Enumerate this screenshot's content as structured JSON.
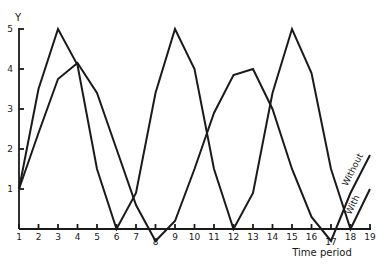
{
  "chart_data": {
    "type": "line",
    "title": "",
    "xlabel": "Time period",
    "ylabel": "Y",
    "x": [
      1,
      2,
      3,
      4,
      5,
      6,
      7,
      8,
      9,
      10,
      11,
      12,
      13,
      14,
      15,
      16,
      17,
      18,
      19
    ],
    "x_tick_labels": [
      "1",
      "2",
      "3",
      "4",
      "5",
      "6",
      "7",
      "8",
      "9",
      "10",
      "11",
      "12",
      "13",
      "14",
      "15",
      "16",
      "17",
      "18",
      "19"
    ],
    "y_tick_labels": [
      "1",
      "2",
      "3",
      "4",
      "5"
    ],
    "y_ticks": [
      1,
      2,
      3,
      4,
      5
    ],
    "xlim": [
      1,
      19
    ],
    "ylim": [
      0,
      5
    ],
    "grid": false,
    "legend": "inline labels at right end of lines",
    "series": [
      {
        "name": "With",
        "values": [
          1,
          3.5,
          5,
          4.1,
          1.5,
          0,
          0.9,
          3.4,
          5,
          4,
          1.5,
          0,
          0.9,
          3.4,
          5,
          3.9,
          1.5,
          0,
          1.0
        ]
      },
      {
        "name": "Without",
        "values": [
          1,
          2.4,
          3.75,
          4.15,
          3.4,
          2,
          0.6,
          -0.3,
          0.2,
          1.5,
          2.9,
          3.85,
          4,
          3,
          1.5,
          0.3,
          -0.3,
          0.9,
          1.85
        ]
      }
    ]
  }
}
